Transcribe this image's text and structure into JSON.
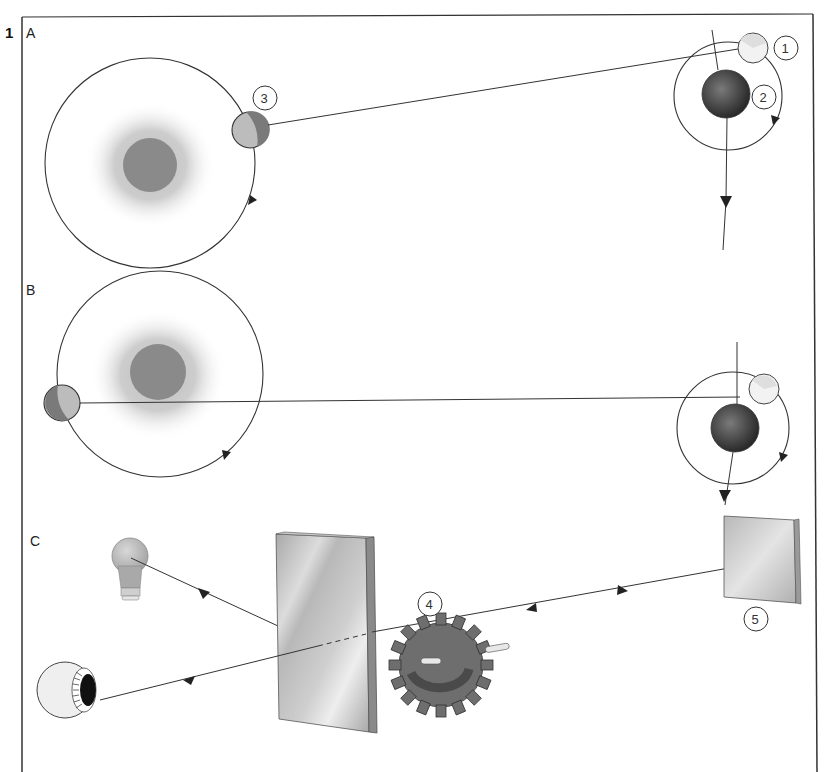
{
  "figure": {
    "number": "1",
    "panels": [
      {
        "id": "A",
        "label": "A"
      },
      {
        "id": "B",
        "label": "B"
      },
      {
        "id": "C",
        "label": "C"
      }
    ],
    "callouts": [
      "1",
      "2",
      "3",
      "4",
      "5"
    ],
    "colors": {
      "frame": "#333333",
      "line": "#333333",
      "sun_halo": "#c8c8c8",
      "sun_core": "#8a8a8a",
      "jupiter": "#555555",
      "moon_light": "#d8d8d8",
      "earth": "#8e8e8e",
      "mirror_face": "#c4c4c4",
      "mirror_edge": "#9a9a9a",
      "cogwheel": "#6e6e6e",
      "bulb": "#bdbdbd"
    }
  }
}
